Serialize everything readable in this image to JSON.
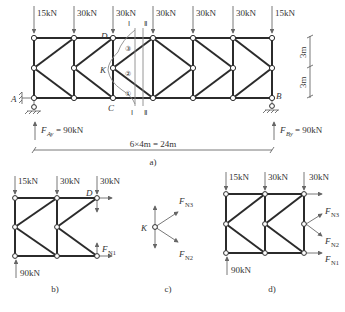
{
  "figure": {
    "a": {
      "caption": "a)",
      "loads": [
        "15kN",
        "30kN",
        "30kN",
        "30kN",
        "30kN",
        "30kN",
        "15kN"
      ],
      "node_labels": {
        "D": "D",
        "K": "K",
        "C": "C",
        "A": "A",
        "B": "B"
      },
      "member_labels": [
        "③",
        "②",
        "①"
      ],
      "section_labels": {
        "I_top": "Ⅰ",
        "II_top": "Ⅱ",
        "I_bottom": "Ⅰ",
        "II_bottom": "Ⅱ"
      },
      "reactions": {
        "A": "= 90kN",
        "A_sym": "F",
        "A_sub": "Ay",
        "B": "= 90kN",
        "B_sym": "F",
        "B_sub": "By"
      },
      "dimensions": {
        "span": "6×4m = 24m",
        "height_top": "3m",
        "height_bottom": "3m"
      }
    },
    "b": {
      "caption": "b)",
      "loads": [
        "15kN",
        "30kN",
        "30kN"
      ],
      "support": "90kN",
      "node_label": "D",
      "force": {
        "sym": "F",
        "sub": "N1"
      }
    },
    "c": {
      "caption": "c)",
      "node_label": "K",
      "forces": [
        {
          "sym": "F",
          "sub": "N3"
        },
        {
          "sym": "F",
          "sub": "N2"
        }
      ]
    },
    "d": {
      "caption": "d)",
      "loads": [
        "15kN",
        "30kN",
        "30kN"
      ],
      "support": "90kN",
      "forces": [
        {
          "sym": "F",
          "sub": "N3"
        },
        {
          "sym": "F",
          "sub": "N2"
        },
        {
          "sym": "F",
          "sub": "N1"
        }
      ]
    }
  }
}
